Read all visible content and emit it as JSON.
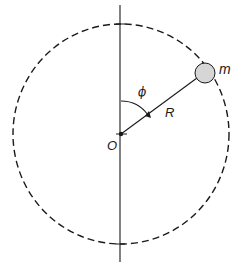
{
  "diagram": {
    "title": "",
    "labels": {
      "mass": "m",
      "radius": "R",
      "angle": "ϕ",
      "origin": "O"
    },
    "geometry": {
      "center": [
        121,
        134
      ],
      "circle_radius": 109,
      "axis_top": 5,
      "axis_bottom": 262,
      "mass_position": [
        205,
        73
      ],
      "mass_radius": 10,
      "angle_arc_radius": 33
    },
    "colors": {
      "line": "#1a1a1a",
      "mass_fill": "#d6d6d6",
      "background": "#ffffff"
    }
  }
}
